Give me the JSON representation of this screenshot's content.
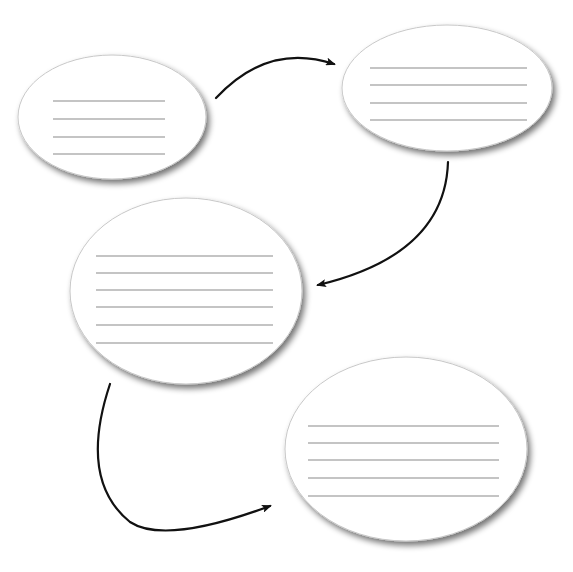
{
  "diagram": {
    "type": "flow-of-ellipses",
    "colors": {
      "background": "#ffffff",
      "node_fill": "#ffffff",
      "node_stroke": "#c8c8c8",
      "line": "#8a8a8a",
      "arrow": "#111111"
    },
    "nodes": [
      {
        "id": "node-1",
        "cx": 112,
        "cy": 117,
        "rx": 94,
        "ry": 62,
        "line_x1": 53,
        "line_x2": 165,
        "lines_y": [
          101,
          119,
          137,
          154
        ]
      },
      {
        "id": "node-2",
        "cx": 447,
        "cy": 88,
        "rx": 105,
        "ry": 63,
        "line_x1": 370,
        "line_x2": 527,
        "lines_y": [
          68,
          85,
          103,
          120
        ]
      },
      {
        "id": "node-3",
        "cx": 186,
        "cy": 291,
        "rx": 116,
        "ry": 93,
        "line_x1": 96,
        "line_x2": 273,
        "lines_y": [
          256,
          273,
          290,
          307,
          325,
          343
        ]
      },
      {
        "id": "node-4",
        "cx": 406,
        "cy": 449,
        "rx": 121,
        "ry": 92,
        "line_x1": 308,
        "line_x2": 499,
        "lines_y": [
          426,
          443,
          460,
          478,
          496
        ]
      }
    ],
    "arrows": [
      {
        "id": "arrow-1-2",
        "from": "node-1",
        "to": "node-2",
        "path": "M216,98 Q268,42 334,64"
      },
      {
        "id": "arrow-2-3",
        "from": "node-2",
        "to": "node-3",
        "path": "M448,162 Q445,255 318,285"
      },
      {
        "id": "arrow-3-4",
        "from": "node-3",
        "to": "node-4",
        "path": "M110,384 Q78,480 130,522 Q165,545 270,506"
      }
    ]
  }
}
